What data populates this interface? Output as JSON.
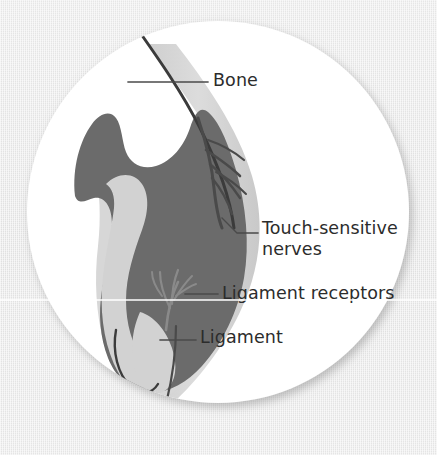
{
  "figure": {
    "kind": "anatomical-illustration",
    "shape": "circular-inset",
    "background_color": "#e9e9e9",
    "disc_color": "#ffffff",
    "bone_mass_color": "#6b6b6b",
    "ligament_tissue_color": "#d2d2d2",
    "outline_color": "#3b3b3b",
    "label_text_color": "#2c2c2c",
    "leader_line_color": "#4a4a4a"
  },
  "labels": {
    "bone": "Bone",
    "touch_sensitive_nerves": "Touch-sensitive\nnerves",
    "ligament_receptors": "Ligament receptors",
    "ligament": "Ligament"
  },
  "structures": [
    {
      "name": "bone",
      "description": "dark curved cortical bone edge running from upper area down the right side of the disc"
    },
    {
      "name": "cartilage-mass",
      "description": "large dark gray mass filling the centre of the joint"
    },
    {
      "name": "ligament",
      "description": "pale gray fibrous band running vertically through the joint"
    },
    {
      "name": "touch-sensitive-nerves",
      "description": "fine branching nerve fibres fanning out in the upper right of the joint"
    },
    {
      "name": "ligament-receptors",
      "description": "branching receptor endings within the lower ligament"
    }
  ]
}
